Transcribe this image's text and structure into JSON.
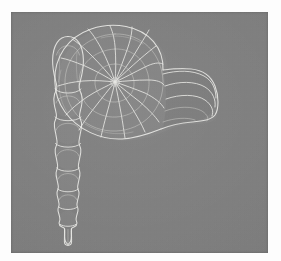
{
  "figure": {
    "kind": "scientific-plate-photograph",
    "background_color": "#7d7d7d",
    "line_color": "#e9e9e6",
    "border_color": "#fdfdfd",
    "plate": {
      "left": 11,
      "top": 12,
      "width": 257,
      "height": 241
    }
  },
  "specimens": [
    {
      "id": "specimen-left",
      "name": "uniserial-foraminifera",
      "common_form": "Nodosaria-like uniserial test",
      "orientation": "vertical",
      "position": {
        "x": 45,
        "y": 20,
        "width": 40,
        "height": 205
      },
      "chamber_count": 7,
      "features": [
        "inflated ovate apical chamber",
        "six globular chambers decreasing in size downward",
        "constricted sutures between chambers",
        "short terminal spine at base"
      ],
      "chambers": [
        {
          "index": 1,
          "cy": 48,
          "rx": 15.5,
          "ry": 24.0,
          "label": "apical-chamber"
        },
        {
          "index": 2,
          "cy": 92,
          "rx": 14.5,
          "ry": 14.0,
          "label": "chamber-2"
        },
        {
          "index": 3,
          "cy": 119,
          "rx": 14.0,
          "ry": 13.5,
          "label": "chamber-3"
        },
        {
          "index": 4,
          "cy": 145,
          "rx": 13.2,
          "ry": 13.0,
          "label": "chamber-4"
        },
        {
          "index": 5,
          "cy": 168,
          "rx": 12.0,
          "ry": 11.8,
          "label": "chamber-5"
        },
        {
          "index": 6,
          "cy": 189,
          "rx": 10.6,
          "ry": 10.4,
          "label": "chamber-6"
        },
        {
          "index": 7,
          "cy": 207,
          "rx": 9.2,
          "ry": 9.0,
          "label": "chamber-7"
        }
      ],
      "terminal_spine": {
        "cx": 57,
        "top": 214,
        "bottom": 232,
        "half_width": 3.4
      }
    },
    {
      "id": "specimen-right",
      "name": "planispiral-coiled-shell",
      "common_form": "Involute planispiral test with radiating chamber sutures",
      "orientation": "lateral-view",
      "position": {
        "x": 105,
        "y": 72,
        "width": 140,
        "height": 130
      },
      "umbilicus": {
        "cx": 52,
        "cy": 60
      },
      "visible_whorl_sutures": 17,
      "features": [
        "tightly coiled logarithmic spiral centred on a small umbilicus",
        "radiating curved chamber sutures expanding outward",
        "broad rounded periphery",
        "flattened apertural face on the right margin",
        "finely stippled shell surface"
      ]
    }
  ],
  "labels": {
    "plate_caption": "",
    "figure_numbers": []
  }
}
